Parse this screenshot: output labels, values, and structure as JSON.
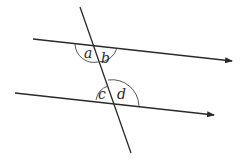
{
  "diagram": {
    "angles": [
      {
        "label": "a",
        "position": "top intersection, upper-left... below top line, left of transversal"
      },
      {
        "label": "b",
        "position": "top intersection, below top line, right of transversal"
      },
      {
        "label": "c",
        "position": "bottom intersection, above bottom line, left of transversal"
      },
      {
        "label": "d",
        "position": "bottom intersection, above bottom line, right of transversal"
      }
    ],
    "labels": {
      "a": "a",
      "b": "b",
      "c": "c",
      "d": "d"
    },
    "colors": {
      "line": "#2a2a2a",
      "background": "#ffffff"
    }
  }
}
